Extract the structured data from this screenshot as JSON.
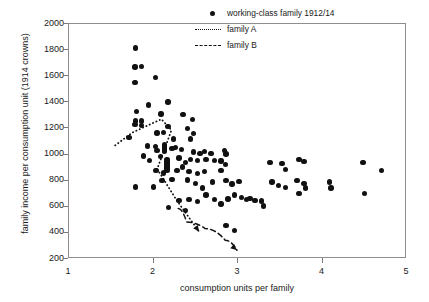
{
  "chart_data": {
    "type": "scatter",
    "title": "",
    "xlabel": "consumption units per family",
    "ylabel": "family income per consumption unit (1914 crowns)",
    "xlim": [
      1,
      5
    ],
    "ylim": [
      200,
      2000
    ],
    "xticks": [
      1,
      2,
      3,
      4,
      5
    ],
    "yticks": [
      200,
      400,
      600,
      800,
      1000,
      1200,
      1400,
      1600,
      1800,
      2000
    ],
    "grid": false,
    "legend_position": "top-right",
    "series": [
      {
        "name": "working-class family 1912/14",
        "marker": "filled-circle",
        "color": "#111111",
        "points": [
          [
            1.79,
            1815
          ],
          [
            1.78,
            1670
          ],
          [
            1.86,
            1675
          ],
          [
            1.78,
            1550
          ],
          [
            2.02,
            1588
          ],
          [
            1.8,
            1330
          ],
          [
            1.94,
            1380
          ],
          [
            2.17,
            1402
          ],
          [
            1.79,
            1258
          ],
          [
            1.78,
            1228
          ],
          [
            1.86,
            1258
          ],
          [
            1.86,
            1222
          ],
          [
            2.09,
            1312
          ],
          [
            2.35,
            1305
          ],
          [
            2.46,
            1268
          ],
          [
            2.17,
            1215
          ],
          [
            2.4,
            1200
          ],
          [
            2.47,
            1160
          ],
          [
            1.71,
            1130
          ],
          [
            2.04,
            1165
          ],
          [
            2.12,
            1170
          ],
          [
            2.24,
            1118
          ],
          [
            2.44,
            1120
          ],
          [
            2.13,
            1072
          ],
          [
            2.13,
            1058
          ],
          [
            2.13,
            1042
          ],
          [
            2.13,
            1026
          ],
          [
            1.93,
            1065
          ],
          [
            2.02,
            1062
          ],
          [
            2.04,
            1030
          ],
          [
            2.22,
            1048
          ],
          [
            2.26,
            1052
          ],
          [
            2.33,
            1040
          ],
          [
            2.47,
            1020
          ],
          [
            2.55,
            1010
          ],
          [
            2.6,
            1025
          ],
          [
            2.68,
            1008
          ],
          [
            2.86,
            1005
          ],
          [
            2.84,
            1030
          ],
          [
            1.88,
            990
          ],
          [
            1.95,
            955
          ],
          [
            2.08,
            985
          ],
          [
            2.16,
            960
          ],
          [
            2.16,
            944
          ],
          [
            2.16,
            928
          ],
          [
            2.16,
            912
          ],
          [
            2.16,
            896
          ],
          [
            2.16,
            880
          ],
          [
            2.3,
            975
          ],
          [
            2.38,
            940
          ],
          [
            2.44,
            962
          ],
          [
            2.52,
            955
          ],
          [
            2.62,
            960
          ],
          [
            2.72,
            955
          ],
          [
            2.8,
            950
          ],
          [
            2.85,
            925
          ],
          [
            2.03,
            880
          ],
          [
            2.12,
            860
          ],
          [
            2.28,
            880
          ],
          [
            2.34,
            905
          ],
          [
            2.42,
            870
          ],
          [
            2.52,
            855
          ],
          [
            2.6,
            870
          ],
          [
            2.8,
            880
          ],
          [
            1.79,
            752
          ],
          [
            2.0,
            752
          ],
          [
            2.1,
            800
          ],
          [
            2.22,
            810
          ],
          [
            2.4,
            805
          ],
          [
            2.5,
            780
          ],
          [
            2.58,
            745
          ],
          [
            2.7,
            790
          ],
          [
            2.86,
            800
          ],
          [
            2.93,
            775
          ],
          [
            3.01,
            795
          ],
          [
            2.18,
            595
          ],
          [
            2.3,
            650
          ],
          [
            2.42,
            655
          ],
          [
            2.38,
            570
          ],
          [
            2.52,
            640
          ],
          [
            2.62,
            690
          ],
          [
            2.72,
            655
          ],
          [
            2.8,
            620
          ],
          [
            2.88,
            660
          ],
          [
            2.96,
            690
          ],
          [
            3.04,
            672
          ],
          [
            3.1,
            655
          ],
          [
            3.14,
            662
          ],
          [
            3.2,
            650
          ],
          [
            3.28,
            645
          ],
          [
            3.3,
            605
          ],
          [
            2.86,
            455
          ],
          [
            2.96,
            420
          ],
          [
            3.38,
            940
          ],
          [
            3.52,
            930
          ],
          [
            3.56,
            885
          ],
          [
            3.72,
            960
          ],
          [
            3.78,
            945
          ],
          [
            3.4,
            790
          ],
          [
            3.48,
            765
          ],
          [
            3.56,
            750
          ],
          [
            3.7,
            800
          ],
          [
            3.78,
            780
          ],
          [
            3.8,
            745
          ],
          [
            3.72,
            700
          ],
          [
            4.08,
            790
          ],
          [
            4.1,
            745
          ],
          [
            4.48,
            940
          ],
          [
            4.5,
            700
          ],
          [
            4.7,
            880
          ]
        ]
      }
    ],
    "annotations": [
      {
        "name": "family A",
        "style": "dotted",
        "arrow": true,
        "path": [
          [
            1.55,
            1062
          ],
          [
            1.75,
            1160
          ],
          [
            2.1,
            1265
          ],
          [
            2.22,
            1180
          ],
          [
            2.05,
            880
          ],
          [
            2.28,
            640
          ],
          [
            2.55,
            395
          ]
        ]
      },
      {
        "name": "family B",
        "style": "dashed",
        "arrow": true,
        "path": [
          [
            2.3,
            575
          ],
          [
            2.4,
            470
          ],
          [
            2.62,
            420
          ],
          [
            2.86,
            330
          ],
          [
            3.0,
            252
          ]
        ]
      }
    ]
  },
  "axes": {
    "ylabel": "family income per consumption unit (1914 crowns)",
    "xlabel": "consumption units per family",
    "ytick_labels": [
      "2000",
      "1800",
      "1600",
      "1400",
      "1200",
      "1000",
      "800",
      "600",
      "400",
      "200"
    ],
    "xtick_labels": [
      "1",
      "2",
      "3",
      "4",
      "5"
    ]
  },
  "legend": {
    "items": [
      {
        "label": "working-class family 1912/14",
        "key": "marker-dot-icon"
      },
      {
        "label": "family A",
        "key": "dotted-line-icon"
      },
      {
        "label": "family B",
        "key": "dashed-line-icon"
      }
    ]
  }
}
